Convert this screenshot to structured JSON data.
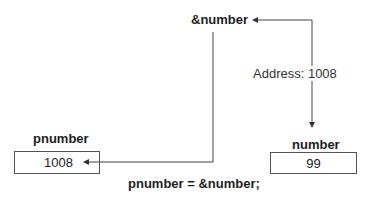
{
  "diagram": {
    "address_of_label": "&number",
    "address_annotation": "Address: 1008",
    "pointer": {
      "name": "pnumber",
      "value": "1008"
    },
    "variable": {
      "name": "number",
      "value": "99"
    },
    "statement": "pnumber = &number;"
  },
  "colors": {
    "line": "#444444",
    "text": "#1e1e1e",
    "box_border": "#555555"
  }
}
